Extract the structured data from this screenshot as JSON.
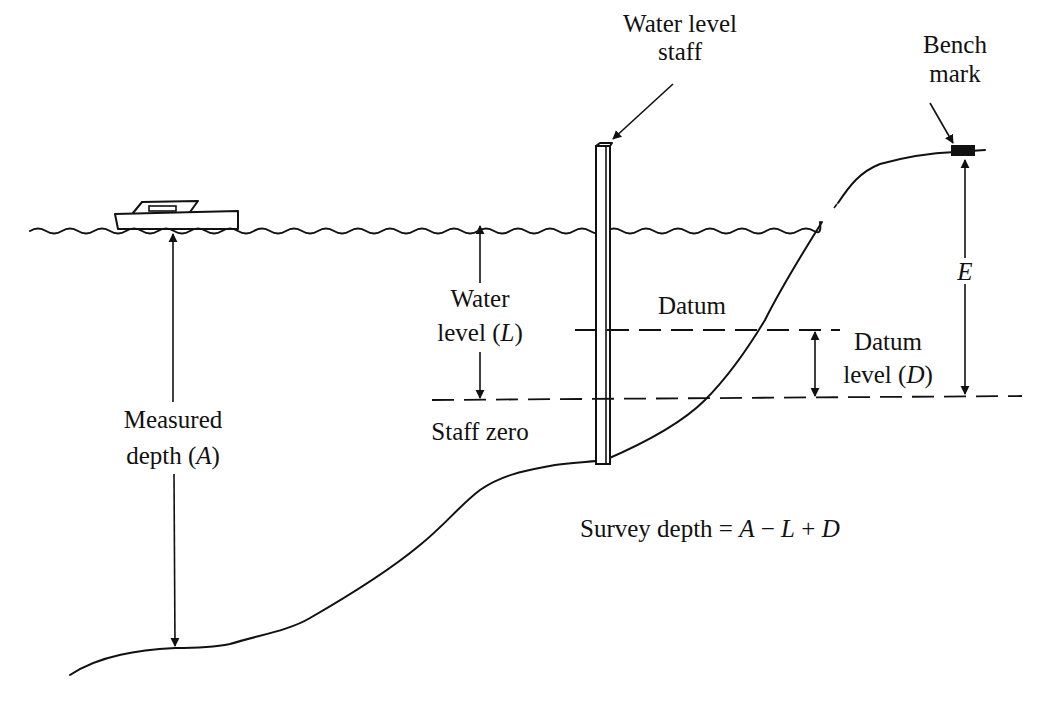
{
  "diagram": {
    "type": "hydrographic survey depth reduction",
    "labels": {
      "staff_line1": "Water level",
      "staff_line2": "staff",
      "bench_line1": "Bench",
      "bench_line2": "mark",
      "water_line1": "Water",
      "water_line2_pre": "level (",
      "water_var": "L",
      "water_line2_post": ")",
      "datum": "Datum",
      "datum_level_line1": "Datum",
      "datum_level_line2_pre": "level (",
      "datum_var": "D",
      "datum_level_line2_post": ")",
      "e_var": "E",
      "staff_zero": "Staff zero",
      "measured_line1": "Measured",
      "measured_line2_pre": "depth (",
      "measured_var": "A",
      "measured_line2_post": ")",
      "formula_pre": "Survey depth = ",
      "formula_A": "A",
      "formula_minus": " − ",
      "formula_L": "L",
      "formula_plus": " + ",
      "formula_D": "D"
    },
    "elements": [
      "boat",
      "water-surface",
      "water-level-staff",
      "bench-mark",
      "seabed-profile",
      "datum-line",
      "staff-zero-line"
    ],
    "colors": {
      "ink": "#111111",
      "background": "#ffffff"
    }
  }
}
